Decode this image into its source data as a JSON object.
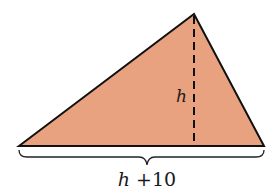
{
  "diagram": {
    "type": "triangle",
    "fill_color": "#E8A27F",
    "stroke_color": "#111111",
    "height_label": "h",
    "base_label_var": "h",
    "base_label_rest": " +10",
    "base_label_full": "h +10"
  }
}
